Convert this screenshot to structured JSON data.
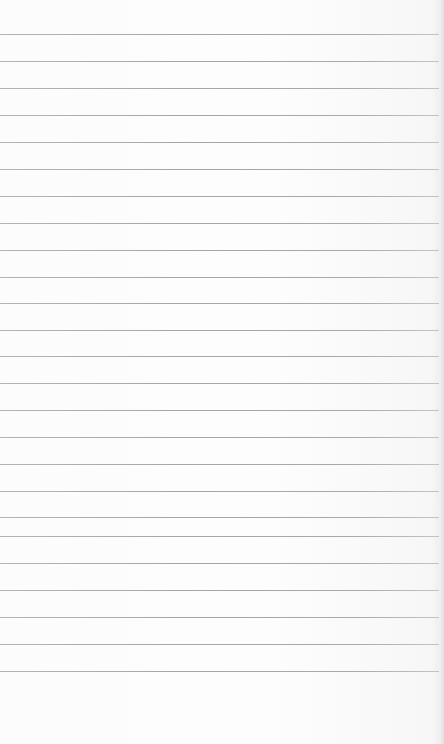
{
  "paper": {
    "type": "lined-notepad-sheet",
    "background_color": "#fbfbfb",
    "rule_color": "#a8a8a8",
    "rule_length_px": 439,
    "rule_positions_y": [
      34,
      61,
      88,
      115,
      142,
      169,
      196,
      223,
      250,
      277,
      303,
      330,
      356,
      383,
      410,
      437,
      464,
      491,
      517,
      536,
      563,
      590,
      617,
      644,
      671
    ]
  }
}
